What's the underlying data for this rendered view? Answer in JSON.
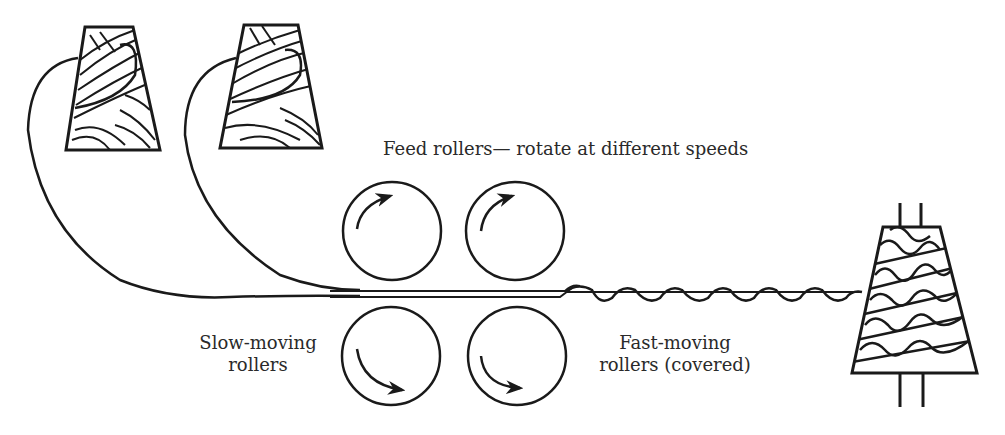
{
  "diagram": {
    "title_label": "Feed rollers— rotate at different speeds",
    "slow_label": {
      "line1": "Slow-moving",
      "line2": "rollers"
    },
    "fast_label": {
      "line1": "Fast-moving",
      "line2": "rollers (covered)"
    },
    "components": [
      {
        "name": "yarn-cone-left",
        "type": "supply cone"
      },
      {
        "name": "yarn-cone-middle",
        "type": "supply cone"
      },
      {
        "name": "feed-roller-top-left",
        "rotation": "clockwise"
      },
      {
        "name": "feed-roller-top-right",
        "rotation": "clockwise"
      },
      {
        "name": "slow-roller-bottom-left",
        "rotation": "counter-clockwise"
      },
      {
        "name": "fast-roller-bottom-right",
        "rotation": "counter-clockwise"
      },
      {
        "name": "take-up-cone",
        "type": "boucle yarn package"
      }
    ],
    "stroke_color": "#1a1a1a"
  }
}
